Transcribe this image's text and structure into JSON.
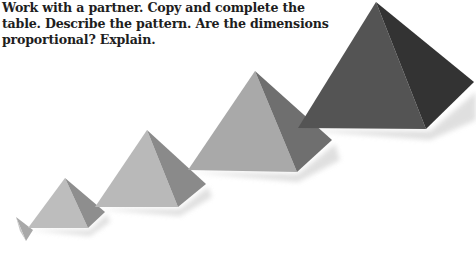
{
  "instruction": {
    "line1": "Work with a partner. Copy and complete the",
    "line2": "table. Describe the pattern. Are the dimensions",
    "line3": "proportional? Explain."
  },
  "illustration": {
    "description": "Five square pyramids of increasing size arranged diagonally from lower-left to upper-right, darkening in shade as they grow",
    "pyramids": [
      {
        "index": 1,
        "shade_light": "#bdbdbd",
        "shade_dark": "#9a9a9a"
      },
      {
        "index": 2,
        "shade_light": "#bcbcbc",
        "shade_dark": "#8e8e8e"
      },
      {
        "index": 3,
        "shade_light": "#b8b8b8",
        "shade_dark": "#8a8a8a"
      },
      {
        "index": 4,
        "shade_light": "#a9a9a9",
        "shade_dark": "#6f6f6f"
      },
      {
        "index": 5,
        "shade_light": "#545454",
        "shade_dark": "#333333"
      }
    ]
  }
}
